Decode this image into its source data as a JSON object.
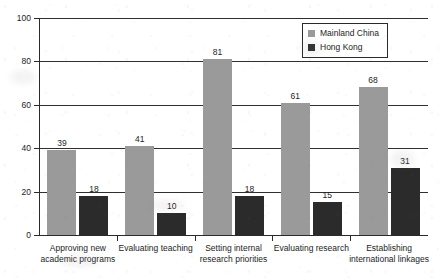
{
  "chart_data": {
    "type": "bar",
    "title": "",
    "xlabel": "",
    "ylabel": "",
    "ylim": [
      0,
      100
    ],
    "yticks": [
      0,
      20,
      40,
      60,
      80,
      100
    ],
    "grid": true,
    "legend_position": "top-right",
    "categories": [
      [
        "Approving new",
        "academic programs"
      ],
      [
        "Evaluating teaching"
      ],
      [
        "Setting internal",
        "research priorities"
      ],
      [
        "Evaluating research"
      ],
      [
        "Establishing",
        "international linkages"
      ]
    ],
    "series": [
      {
        "name": "Mainland China",
        "color": "#9a9a9a",
        "values": [
          39,
          41,
          81,
          61,
          68
        ]
      },
      {
        "name": "Hong Kong",
        "color": "#2b2b2b",
        "values": [
          18,
          10,
          18,
          15,
          31
        ]
      }
    ]
  }
}
